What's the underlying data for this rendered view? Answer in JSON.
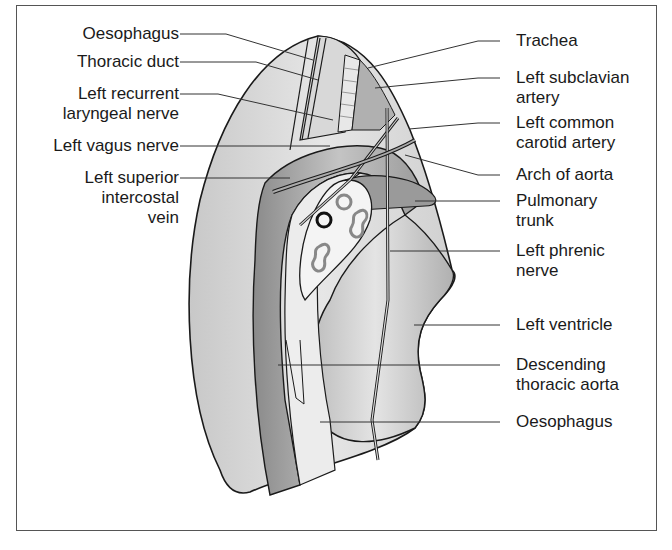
{
  "figure": {
    "labels_left": [
      {
        "id": "oesophagus-top",
        "text": "Oesophagus"
      },
      {
        "id": "thoracic-duct",
        "text": "Thoracic duct"
      },
      {
        "id": "left-recurrent-laryngeal-nerve",
        "text": "Left recurrent\nlaryngeal nerve"
      },
      {
        "id": "left-vagus-nerve",
        "text": "Left vagus nerve"
      },
      {
        "id": "left-superior-intercostal-vein",
        "text": "Left superior\nintercostal\nvein"
      }
    ],
    "labels_right": [
      {
        "id": "trachea",
        "text": "Trachea"
      },
      {
        "id": "left-subclavian-artery",
        "text": "Left subclavian\nartery"
      },
      {
        "id": "left-common-carotid-artery",
        "text": "Left common\ncarotid artery"
      },
      {
        "id": "arch-of-aorta",
        "text": "Arch of aorta"
      },
      {
        "id": "pulmonary-trunk",
        "text": "Pulmonary\ntrunk"
      },
      {
        "id": "left-phrenic-nerve",
        "text": "Left phrenic\nnerve"
      },
      {
        "id": "left-ventricle",
        "text": "Left ventricle"
      },
      {
        "id": "descending-thoracic-aorta",
        "text": "Descending\nthoracic aorta"
      },
      {
        "id": "oesophagus-bottom",
        "text": "Oesophagus"
      }
    ]
  },
  "colors": {
    "outline": "#1a1a1a",
    "frame": "#555555",
    "leader": "#333333",
    "light_fill": "#dcdcdc",
    "mid_fill": "#a8a8a8",
    "dark_fill": "#7a7a7a",
    "white_fill": "#f4f4f4"
  }
}
